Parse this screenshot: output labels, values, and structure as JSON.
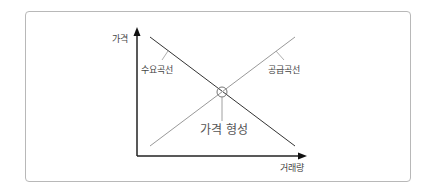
{
  "diagram": {
    "type": "supply-demand",
    "axes": {
      "y_label": "가격",
      "x_label": "거래량"
    },
    "curves": {
      "demand_label": "수요곡선",
      "supply_label": "공급곡선"
    },
    "equilibrium_label": "가격 형성",
    "colors": {
      "axis": "#222222",
      "demand_line": "#333333",
      "supply_line": "#999999",
      "frame": "#b8b8b8",
      "text": "#444444"
    }
  }
}
